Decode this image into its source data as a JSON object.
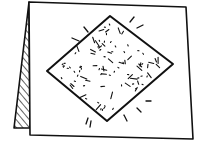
{
  "illustration": {
    "title": "Card with sparkling diamond",
    "subject": "folded-card",
    "colors": {
      "ink": "#111111",
      "paper": "#ffffff"
    },
    "card": {
      "front": [
        [
          29,
          2
        ],
        [
          186,
          7
        ],
        [
          193,
          139
        ],
        [
          30,
          135
        ]
      ],
      "fold": [
        [
          29,
          2
        ],
        [
          14,
          128
        ],
        [
          30,
          128
        ]
      ]
    },
    "diamond": {
      "points": [
        [
          47,
          71
        ],
        [
          110,
          16
        ],
        [
          173,
          64
        ],
        [
          107,
          121
        ]
      ]
    },
    "sparkle_rays": [
      [
        [
          72,
          38
        ],
        [
          79,
          41
        ]
      ],
      [
        [
          84,
          27
        ],
        [
          88,
          32
        ]
      ],
      [
        [
          130,
          22
        ],
        [
          134,
          17
        ]
      ],
      [
        [
          137,
          28
        ],
        [
          143,
          25
        ]
      ],
      [
        [
          146,
          101
        ],
        [
          151,
          101
        ]
      ],
      [
        [
          137,
          108
        ],
        [
          141,
          112
        ]
      ],
      [
        [
          124,
          115
        ],
        [
          127,
          121
        ]
      ],
      [
        [
          88,
          118
        ],
        [
          86,
          124
        ]
      ],
      [
        [
          91,
          121
        ],
        [
          90,
          127
        ]
      ]
    ]
  }
}
